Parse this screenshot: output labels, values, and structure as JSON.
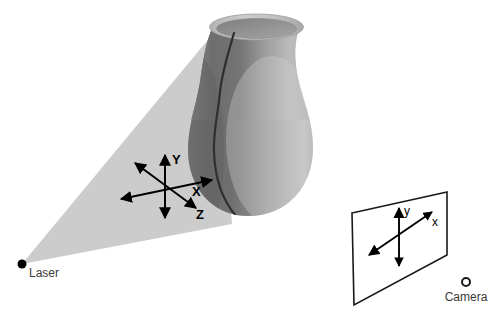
{
  "figure": {
    "background_color": "#ffffff",
    "width": 501,
    "height": 331
  },
  "laser": {
    "label": "Laser",
    "marker_shape": "filled-dot",
    "marker_color": "#000000",
    "origin": {
      "x": 22,
      "y": 264
    },
    "light_fan": {
      "name": "laser-light-fan",
      "fill_color": "#cccccc",
      "edge_top": {
        "x": 216,
        "y": 30
      },
      "edge_bottom": {
        "x": 232,
        "y": 224
      }
    }
  },
  "object": {
    "name": "vase",
    "body_color_dark": "#6e6e6e",
    "body_color_light": "#c4c4c4",
    "rim_color": "#b9b9b9",
    "stripe_color": "#2b2b2b",
    "stripe_name": "laser-stripe-on-object"
  },
  "world_axes": {
    "name": "world-coordinate-system",
    "origin": {
      "x": 165,
      "y": 186
    },
    "axes": [
      {
        "id": "y",
        "label": "Y",
        "direction": "vertical-up",
        "label_x": 172,
        "label_y": 164
      },
      {
        "id": "x",
        "label": "X",
        "direction": "horizontal-right",
        "label_x": 194,
        "label_y": 194
      },
      {
        "id": "z",
        "label": "Z",
        "direction": "diagonal-down-right",
        "label_x": 199,
        "label_y": 214
      }
    ],
    "arrow_color": "#000000"
  },
  "camera": {
    "label": "Camera",
    "marker_shape": "open-circle",
    "marker_color": "#000000",
    "center": {
      "x": 466,
      "y": 282
    },
    "image_plane": {
      "name": "camera-image-plane",
      "stroke_color": "#1a1a1a",
      "fill_color": "#ffffff",
      "corners": [
        {
          "x": 352,
          "y": 213
        },
        {
          "x": 447,
          "y": 192
        },
        {
          "x": 447,
          "y": 255
        },
        {
          "x": 354,
          "y": 305
        }
      ]
    },
    "image_axes": {
      "name": "image-coordinate-system",
      "origin": {
        "x": 399,
        "y": 236
      },
      "axes": [
        {
          "id": "y",
          "label": "y",
          "direction": "vertical-up",
          "label_x": 405,
          "label_y": 210
        },
        {
          "id": "x",
          "label": "x",
          "direction": "diagonal-up-right",
          "label_x": 433,
          "label_y": 224
        }
      ]
    }
  }
}
